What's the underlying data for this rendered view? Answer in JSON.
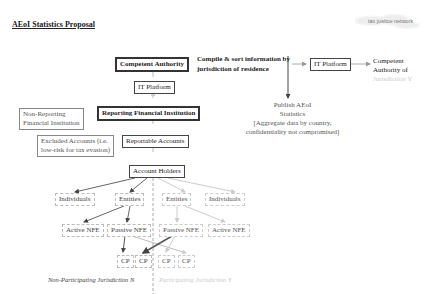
{
  "header": {
    "title": "AEoI Statistics Proposal",
    "logo_text": "tax justice network"
  },
  "top_flow": {
    "competent_authority": "Competent Authority",
    "compile_line1": "Compile & sort information by",
    "compile_line2": "jurisdiction of residence",
    "it_platform_right": "IT Platform",
    "ca_y_line1": "Competent",
    "ca_y_line2": "Authority of",
    "ca_y_line3": "Jurisdiction Y",
    "publish_line1": "Publish AEoI",
    "publish_line2": "Statistics",
    "publish_line3": "[Aggregate data by country,",
    "publish_line4": "confidentiality not compromised]"
  },
  "left_column": {
    "it_platform": "IT Platform",
    "non_reporting_line1": "Non-Reporting",
    "non_reporting_line2": "Financial Institution",
    "reporting_fi": "Reporting Financial Institution",
    "excluded_line1": "Excluded Accounts (i.e.",
    "excluded_line2": "low-risk for tax evasion)",
    "reportable_accounts": "Reportable Accounts",
    "account_holders": "Account Holders"
  },
  "tree": {
    "non_participating": {
      "individuals": "Individuals",
      "entities": "Entities",
      "active_nfe": "Active NFE",
      "passive_nfe": "Passive NFE",
      "cp1": "CP",
      "cp2": "CP",
      "label": "Non-Participating Jurisdiction N"
    },
    "participating": {
      "entities": "Entities",
      "individuals": "Individuals",
      "passive_nfe": "Passive NFE",
      "active_nfe": "Active NFE",
      "cp1": "CP",
      "cp2": "CP",
      "label": "Participating Jurisdiction Y"
    }
  },
  "colors": {
    "dark": "#333333",
    "mid": "#888888",
    "light": "#cccccc"
  }
}
